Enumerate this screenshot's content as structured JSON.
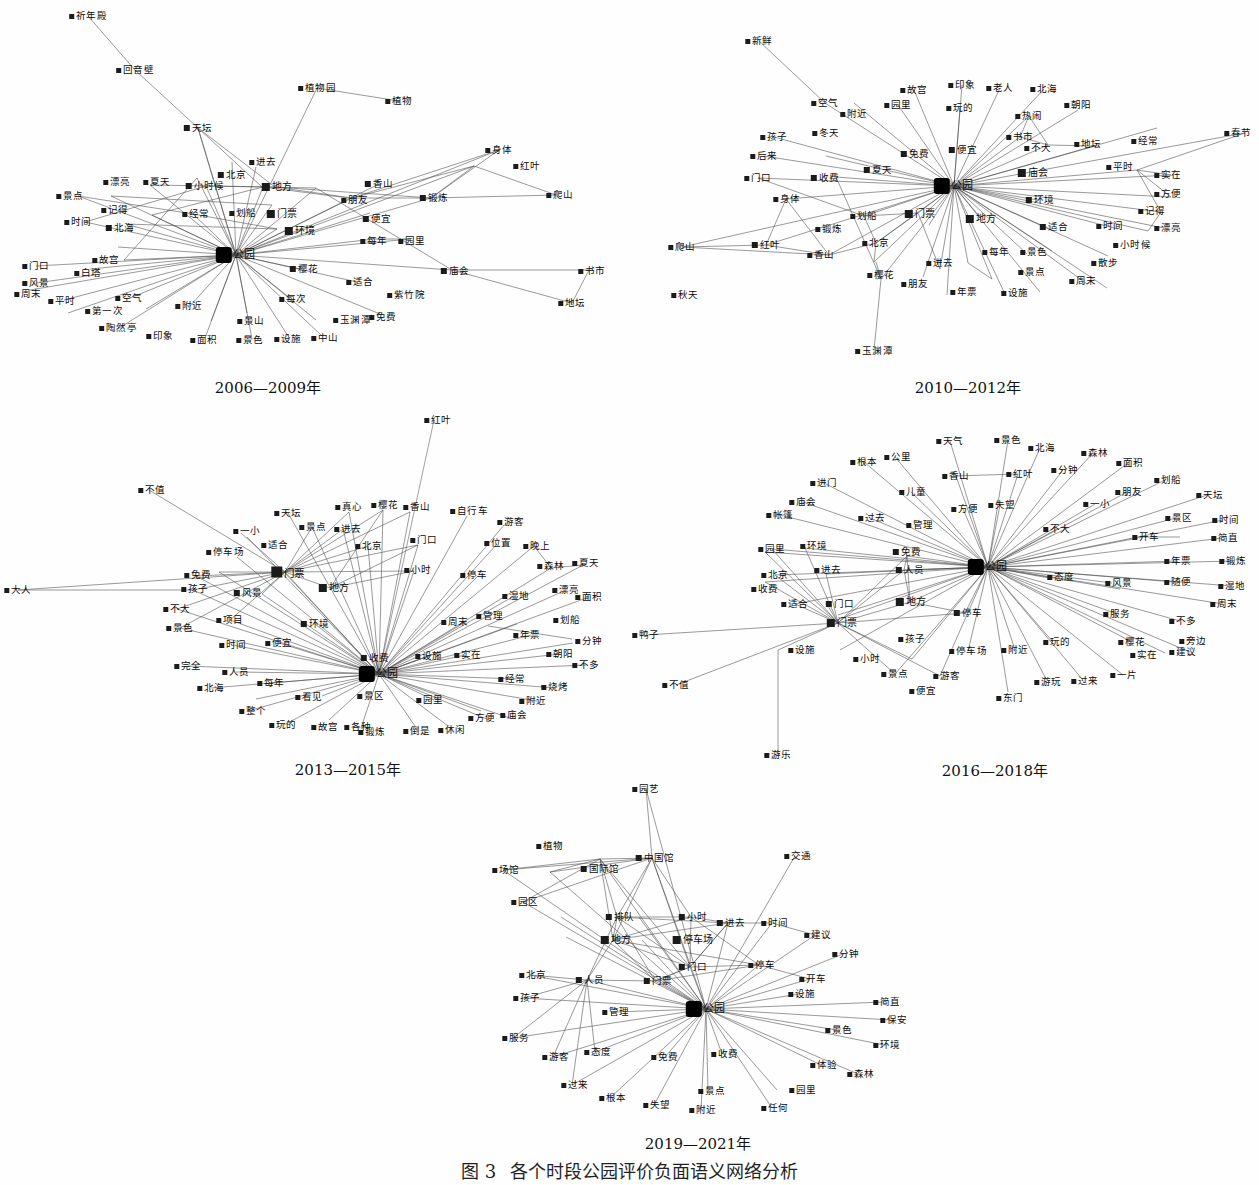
{
  "figure": {
    "caption_number": "图 3",
    "caption_text": "各个时段公园评价负面语义网络分析",
    "hub_label": "公园",
    "node_glyph": "square-marker"
  },
  "panels": [
    {
      "id": "p2006",
      "title": "2006—2009年",
      "hub": "公园",
      "nodes": [
        "祈年殿",
        "回音壁",
        "植物园",
        "植物",
        "天坛",
        "身体",
        "红叶",
        "进去",
        "北京",
        "地方",
        "香山",
        "爬山",
        "漂亮",
        "夏天",
        "小时候",
        "朋友",
        "锻炼",
        "景点",
        "记得",
        "经常",
        "划船",
        "门票",
        "便宜",
        "环境",
        "时间",
        "北海",
        "每年",
        "园里",
        "门口",
        "故宫",
        "白塔",
        "樱花",
        "适合",
        "庙会",
        "书市",
        "风景",
        "周末",
        "平时",
        "空气",
        "附近",
        "每次",
        "紫竹院",
        "地坛",
        "第一次",
        "陶然亭",
        "印象",
        "面积",
        "景山",
        "景色",
        "设施",
        "免费",
        "玉渊潭",
        "中山"
      ]
    },
    {
      "id": "p2010",
      "title": "2010—2012年",
      "hub": "公园",
      "nodes": [
        "新鲜",
        "空气",
        "附近",
        "故宫",
        "园里",
        "印象",
        "玩的",
        "老人",
        "北海",
        "热闹",
        "朝阳",
        "书市",
        "不大",
        "地坛",
        "经常",
        "春节",
        "孩子",
        "冬天",
        "免费",
        "便宜",
        "后来",
        "夏天",
        "平时",
        "实在",
        "门口",
        "收费",
        "庙会",
        "环境",
        "方便",
        "身体",
        "划船",
        "门票",
        "地方",
        "适合",
        "时间",
        "记得",
        "漂亮",
        "爬山",
        "红叶",
        "锻炼",
        "北京",
        "每年",
        "景色",
        "小时候",
        "散步",
        "香山",
        "进去",
        "景点",
        "周末",
        "樱花",
        "朋友",
        "年票",
        "设施",
        "秋天",
        "玉渊潭"
      ]
    },
    {
      "id": "p2013",
      "title": "2013—2015年",
      "hub": "公园",
      "nodes": [
        "红叶",
        "不值",
        "天坛",
        "真心",
        "樱花",
        "香山",
        "自行车",
        "游客",
        "一小",
        "景点",
        "进去",
        "门口",
        "位置",
        "晚上",
        "适合",
        "北京",
        "小时",
        "停车",
        "森林",
        "夏天",
        "停车场",
        "免费",
        "孩子",
        "漂亮",
        "大人",
        "风景",
        "地方",
        "门票",
        "湿地",
        "面积",
        "不大",
        "项目",
        "环境",
        "周末",
        "管理",
        "划船",
        "景色",
        "时间",
        "便宜",
        "年票",
        "分钟",
        "完全",
        "人员",
        "收费",
        "设施",
        "实在",
        "朝阳",
        "不多",
        "北海",
        "每年",
        "看见",
        "景区",
        "园里",
        "经常",
        "烧烤",
        "附近",
        "整个",
        "玩的",
        "故宫",
        "各种",
        "锻炼",
        "倒是",
        "休闲",
        "方便",
        "庙会"
      ]
    },
    {
      "id": "p2016",
      "title": "2016—2018年",
      "hub": "公园",
      "nodes": [
        "天气",
        "景色",
        "北海",
        "森林",
        "根本",
        "公里",
        "香山",
        "红叶",
        "分钟",
        "面积",
        "划船",
        "进门",
        "儿童",
        "方便",
        "失望",
        "一小",
        "朋友",
        "天坛",
        "庙会",
        "过去",
        "管理",
        "不大",
        "景区",
        "时间",
        "帐篷",
        "园里",
        "环境",
        "免费",
        "开车",
        "简直",
        "北京",
        "进去",
        "人员",
        "年票",
        "锻炼",
        "收费",
        "门口",
        "地方",
        "态度",
        "风景",
        "随便",
        "湿地",
        "适合",
        "门票",
        "停车",
        "服务",
        "不多",
        "周末",
        "鸭子",
        "孩子",
        "停车场",
        "附近",
        "玩的",
        "樱花",
        "旁边",
        "设施",
        "小时",
        "游客",
        "实在",
        "建议",
        "景点",
        "便宜",
        "东门",
        "游玩",
        "过来",
        "一片",
        "不值",
        "游乐"
      ]
    },
    {
      "id": "p2019",
      "title": "2019—2021年",
      "hub": "公园",
      "nodes": [
        "园艺",
        "植物",
        "中国馆",
        "交通",
        "场馆",
        "国际馆",
        "园区",
        "排队",
        "小时",
        "进去",
        "时间",
        "地方",
        "停车场",
        "建议",
        "分钟",
        "北京",
        "人员",
        "门口",
        "停车",
        "开车",
        "孩子",
        "门票",
        "设施",
        "管理",
        "简直",
        "服务",
        "保安",
        "景色",
        "环境",
        "游客",
        "态度",
        "免费",
        "收费",
        "体验",
        "森林",
        "过来",
        "根本",
        "失望",
        "景点",
        "园里",
        "附近",
        "任何"
      ]
    }
  ]
}
